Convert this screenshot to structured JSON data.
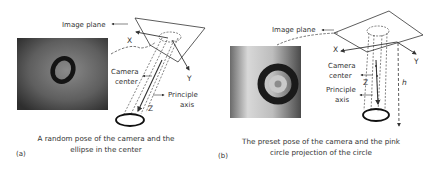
{
  "panels": [
    {
      "tag": "(a)",
      "labels": {
        "image_plane": "Image plane",
        "x_axis": "X",
        "y_axis": "Y",
        "z_axis": "Z",
        "camera_center_line1": "Camera",
        "camera_center_line2": "center",
        "principle_axis_line1": "Principle",
        "principle_axis_line2": "axis"
      },
      "caption_line1": "A random pose of the camera and the",
      "caption_line2": "ellipse in the center"
    },
    {
      "tag": "(b)",
      "labels": {
        "image_plane": "Image plane",
        "x_axis": "X",
        "y_axis": "Y",
        "z_axis": "Z",
        "height": "h",
        "camera_center_line1": "Camera",
        "camera_center_line2": "center",
        "principle_axis_line1": "Principle",
        "principle_axis_line2": "axis"
      },
      "caption_line1": "The preset pose of the camera and the pink",
      "caption_line2": "circle projection of the circle"
    }
  ]
}
